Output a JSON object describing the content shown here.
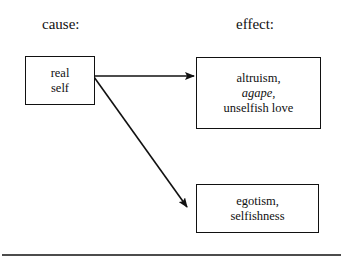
{
  "headers": {
    "cause": "cause:",
    "effect": "effect:"
  },
  "cause_box": {
    "lines": [
      "real",
      "self"
    ]
  },
  "effect_boxes": [
    {
      "lines": [
        "altruism,",
        "agape,",
        "unselfish love"
      ],
      "italic_line": 1
    },
    {
      "lines": [
        "egotism,",
        "selfishness"
      ]
    }
  ],
  "colors": {
    "ink": "#111111",
    "background": "#ffffff"
  }
}
